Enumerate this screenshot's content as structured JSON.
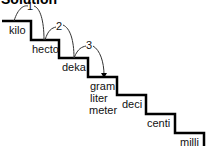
{
  "title": "Solution",
  "steps": [
    {
      "label": "kilo"
    },
    {
      "label": "hecto"
    },
    {
      "label": "deka"
    },
    {
      "label": "gram"
    },
    {
      "label": "liter"
    },
    {
      "label": "meter"
    },
    {
      "label": "deci"
    },
    {
      "label": "centi"
    },
    {
      "label": "milli"
    }
  ],
  "arrows": [
    {
      "label": "1"
    },
    {
      "label": "2"
    },
    {
      "label": "3"
    }
  ]
}
